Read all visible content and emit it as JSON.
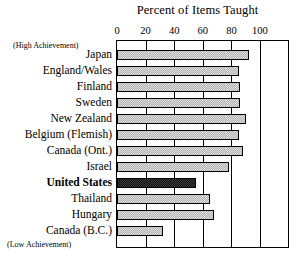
{
  "chart_data": {
    "type": "bar",
    "orientation": "horizontal",
    "title": "Percent of Items Taught",
    "xlabel": "",
    "ylabel": "",
    "xlim": [
      0,
      121
    ],
    "axis_max_label": 100,
    "grid": true,
    "legend": "none",
    "ticks": [
      {
        "label": "0",
        "value": 0
      },
      {
        "label": "20",
        "value": 20
      },
      {
        "label": "40",
        "value": 40
      },
      {
        "label": "60",
        "value": 60
      },
      {
        "label": "80",
        "value": 80
      },
      {
        "label": "100",
        "value": 100
      }
    ],
    "categories": [
      "Japan",
      "England/Wales",
      "Finland",
      "Sweden",
      "New Zealand",
      "Belgium (Flemish)",
      "Canada (Ont.)",
      "Israel",
      "United States",
      "Thailand",
      "Hungary",
      "Canada (B.C.)"
    ],
    "values": [
      92,
      85,
      86,
      86,
      90,
      85,
      88,
      78,
      55,
      65,
      68,
      32
    ],
    "highlight_category": "United States",
    "highlight_color": "#111111",
    "bar_color": "#b3b3b3",
    "annotations": [
      {
        "text": "(High Achievement)",
        "position": "top-left"
      },
      {
        "text": "(Low Achievement)",
        "position": "bottom-left"
      }
    ]
  },
  "annotations": {
    "high": "(High Achievement)",
    "low": "(Low Achievement)"
  }
}
